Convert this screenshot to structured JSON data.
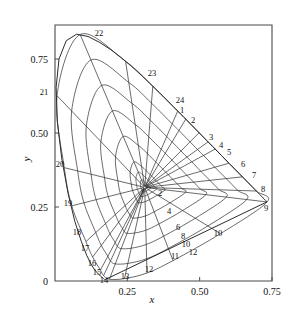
{
  "figure": {
    "title": "",
    "type": "chromaticity-diagram"
  },
  "axes": {
    "x_title": "x",
    "y_title": "y",
    "x_ticks": [
      "0.25",
      "0.50",
      "0.75"
    ],
    "y_ticks": [
      "0",
      "0.25",
      "0.50",
      "0.75"
    ],
    "x_origin_label": "0"
  },
  "chart_data": {
    "type": "line",
    "title": "",
    "xlabel": "x",
    "ylabel": "y",
    "xlim": [
      0.0,
      0.75
    ],
    "ylim": [
      0.0,
      0.9
    ],
    "grid": false,
    "legend": "none",
    "white_point": {
      "x": 0.3101,
      "y": 0.3162
    },
    "xtick_values": [
      0.25,
      0.5,
      0.75
    ],
    "ytick_values": [
      0,
      0.25,
      0.5,
      0.75
    ],
    "spectral_locus": {
      "name": "CIE 1931 spectral locus",
      "points": [
        {
          "x": 0.1741,
          "y": 0.005
        },
        {
          "x": 0.174,
          "y": 0.005
        },
        {
          "x": 0.1738,
          "y": 0.0049
        },
        {
          "x": 0.1736,
          "y": 0.0049
        },
        {
          "x": 0.1733,
          "y": 0.0048
        },
        {
          "x": 0.173,
          "y": 0.0048
        },
        {
          "x": 0.1726,
          "y": 0.0048
        },
        {
          "x": 0.1721,
          "y": 0.0048
        },
        {
          "x": 0.1714,
          "y": 0.0051
        },
        {
          "x": 0.1703,
          "y": 0.0058
        },
        {
          "x": 0.1689,
          "y": 0.0069
        },
        {
          "x": 0.1669,
          "y": 0.0086
        },
        {
          "x": 0.1644,
          "y": 0.0109
        },
        {
          "x": 0.1611,
          "y": 0.0138
        },
        {
          "x": 0.1566,
          "y": 0.0177
        },
        {
          "x": 0.151,
          "y": 0.0227
        },
        {
          "x": 0.144,
          "y": 0.0297
        },
        {
          "x": 0.1355,
          "y": 0.0399
        },
        {
          "x": 0.1241,
          "y": 0.0578
        },
        {
          "x": 0.1096,
          "y": 0.0868
        },
        {
          "x": 0.0913,
          "y": 0.1327
        },
        {
          "x": 0.0687,
          "y": 0.2007
        },
        {
          "x": 0.0454,
          "y": 0.295
        },
        {
          "x": 0.0235,
          "y": 0.4127
        },
        {
          "x": 0.0082,
          "y": 0.5384
        },
        {
          "x": 0.0039,
          "y": 0.6548
        },
        {
          "x": 0.0139,
          "y": 0.7502
        },
        {
          "x": 0.0389,
          "y": 0.812
        },
        {
          "x": 0.0743,
          "y": 0.8338
        },
        {
          "x": 0.1142,
          "y": 0.8262
        },
        {
          "x": 0.1547,
          "y": 0.8059
        },
        {
          "x": 0.1929,
          "y": 0.7816
        },
        {
          "x": 0.2296,
          "y": 0.7543
        },
        {
          "x": 0.2658,
          "y": 0.7243
        },
        {
          "x": 0.3016,
          "y": 0.6923
        },
        {
          "x": 0.3373,
          "y": 0.6589
        },
        {
          "x": 0.3731,
          "y": 0.6245
        },
        {
          "x": 0.4087,
          "y": 0.5896
        },
        {
          "x": 0.4441,
          "y": 0.5547
        },
        {
          "x": 0.4788,
          "y": 0.5202
        },
        {
          "x": 0.5125,
          "y": 0.4866
        },
        {
          "x": 0.5448,
          "y": 0.4544
        },
        {
          "x": 0.5752,
          "y": 0.4242
        },
        {
          "x": 0.6029,
          "y": 0.3965
        },
        {
          "x": 0.627,
          "y": 0.3725
        },
        {
          "x": 0.6482,
          "y": 0.3514
        },
        {
          "x": 0.6658,
          "y": 0.334
        },
        {
          "x": 0.6801,
          "y": 0.3197
        },
        {
          "x": 0.6915,
          "y": 0.3083
        },
        {
          "x": 0.7006,
          "y": 0.2993
        },
        {
          "x": 0.7079,
          "y": 0.292
        },
        {
          "x": 0.714,
          "y": 0.2859
        },
        {
          "x": 0.719,
          "y": 0.2809
        },
        {
          "x": 0.723,
          "y": 0.277
        },
        {
          "x": 0.726,
          "y": 0.274
        },
        {
          "x": 0.7283,
          "y": 0.2717
        },
        {
          "x": 0.73,
          "y": 0.27
        },
        {
          "x": 0.7311,
          "y": 0.2689
        },
        {
          "x": 0.732,
          "y": 0.268
        },
        {
          "x": 0.7327,
          "y": 0.2673
        }
      ]
    },
    "purple_line": {
      "name": "line of purples",
      "from": {
        "x": 0.7327,
        "y": 0.2673
      },
      "to": {
        "x": 0.1741,
        "y": 0.005
      }
    },
    "radial_spokes": {
      "name": "hue spokes",
      "count": 24,
      "labels": [
        "1",
        "2",
        "3",
        "4",
        "5",
        "6",
        "7",
        "8",
        "9",
        "10",
        "11",
        "12",
        "13",
        "14",
        "15",
        "16",
        "17",
        "18",
        "19",
        "20",
        "21",
        "22",
        "23",
        "24"
      ],
      "endpoints": [
        {
          "label": "1",
          "x": 0.424,
          "y": 0.574
        },
        {
          "label": "2",
          "x": 0.452,
          "y": 0.547
        },
        {
          "label": "3",
          "x": 0.498,
          "y": 0.501
        },
        {
          "label": "4",
          "x": 0.529,
          "y": 0.47
        },
        {
          "label": "5",
          "x": 0.554,
          "y": 0.446
        },
        {
          "label": "6",
          "x": 0.601,
          "y": 0.398
        },
        {
          "label": "7",
          "x": 0.648,
          "y": 0.352
        },
        {
          "label": "8",
          "x": 0.696,
          "y": 0.304
        },
        {
          "label": "9",
          "x": 0.733,
          "y": 0.267
        },
        {
          "label": "10",
          "x": 0.572,
          "y": 0.16
        },
        {
          "label": "11",
          "x": 0.408,
          "y": 0.069
        },
        {
          "label": "12",
          "x": 0.318,
          "y": 0.027
        },
        {
          "label": "13",
          "x": 0.24,
          "y": 0.008
        },
        {
          "label": "14",
          "x": 0.188,
          "y": 0.006
        },
        {
          "label": "15",
          "x": 0.168,
          "y": 0.018
        },
        {
          "label": "16",
          "x": 0.157,
          "y": 0.037
        },
        {
          "label": "17",
          "x": 0.13,
          "y": 0.081
        },
        {
          "label": "18",
          "x": 0.107,
          "y": 0.133
        },
        {
          "label": "19",
          "x": 0.058,
          "y": 0.254
        },
        {
          "label": "20",
          "x": 0.032,
          "y": 0.383
        },
        {
          "label": "21",
          "x": 0.007,
          "y": 0.626
        },
        {
          "label": "22",
          "x": 0.087,
          "y": 0.833
        },
        {
          "label": "23",
          "x": 0.244,
          "y": 0.742
        },
        {
          "label": "24",
          "x": 0.338,
          "y": 0.658
        }
      ]
    },
    "chroma_contours": {
      "name": "chroma contours",
      "labels": [
        "2",
        "4",
        "6",
        "8",
        "10",
        "12"
      ],
      "radii": [
        2,
        4,
        6,
        8,
        10,
        12
      ]
    }
  },
  "point_labels": [
    {
      "text": "1",
      "x": 182,
      "y": 113
    },
    {
      "text": "2",
      "x": 193,
      "y": 123
    },
    {
      "text": "3",
      "x": 211,
      "y": 140
    },
    {
      "text": "4",
      "x": 221,
      "y": 148
    },
    {
      "text": "5",
      "x": 229,
      "y": 155
    },
    {
      "text": "6",
      "x": 243,
      "y": 167
    },
    {
      "text": "7",
      "x": 254,
      "y": 178
    },
    {
      "text": "8",
      "x": 263,
      "y": 192
    },
    {
      "text": "9",
      "x": 266,
      "y": 211
    },
    {
      "text": "10",
      "x": 218,
      "y": 236
    },
    {
      "text": "11",
      "x": 175,
      "y": 259
    },
    {
      "text": "12",
      "x": 149,
      "y": 272
    },
    {
      "text": "13",
      "x": 125,
      "y": 279
    },
    {
      "text": "14",
      "x": 104,
      "y": 283
    },
    {
      "text": "15",
      "x": 97,
      "y": 275
    },
    {
      "text": "16",
      "x": 92,
      "y": 266
    },
    {
      "text": "17",
      "x": 85,
      "y": 251
    },
    {
      "text": "18",
      "x": 77,
      "y": 235
    },
    {
      "text": "19",
      "x": 68,
      "y": 206
    },
    {
      "text": "20",
      "x": 60,
      "y": 167
    },
    {
      "text": "21",
      "x": 44,
      "y": 95
    },
    {
      "text": "22",
      "x": 99,
      "y": 36
    },
    {
      "text": "23",
      "x": 152,
      "y": 76
    },
    {
      "text": "24",
      "x": 180,
      "y": 103
    }
  ],
  "ring_labels": [
    {
      "text": "2",
      "x": 160,
      "y": 196
    },
    {
      "text": "4",
      "x": 169,
      "y": 214
    },
    {
      "text": "6",
      "x": 178,
      "y": 230
    },
    {
      "text": "8",
      "x": 183,
      "y": 239
    },
    {
      "text": "10",
      "x": 186,
      "y": 247
    },
    {
      "text": "12",
      "x": 193,
      "y": 255
    }
  ],
  "style": {
    "line_color": "#2b2b2b",
    "axis_color": "#4a4a4a",
    "background": "#ffffff"
  }
}
